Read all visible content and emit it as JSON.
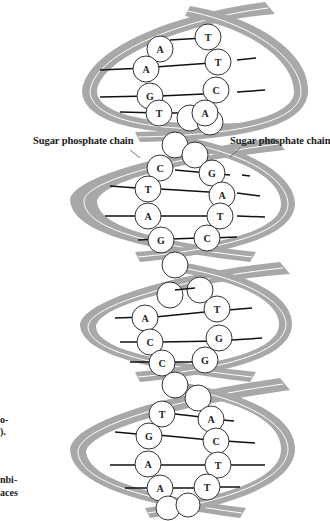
{
  "labels": {
    "left_chain": "Sugar phosphate chain",
    "right_chain": "Sugar phosphate chain"
  },
  "cropped_caption_fragments": [
    "o-",
    ").",
    "nbi-",
    "aces"
  ],
  "colors": {
    "backbone": "#a8a8a8",
    "backbone_highlight": "#ffffff",
    "base_stroke": "#333333",
    "bond": "#111111",
    "background": "#ffffff"
  },
  "turns": [
    {
      "name": "turn-1",
      "pairs": [
        [
          "A",
          "T"
        ],
        [
          "A",
          "T"
        ],
        [
          "G",
          "C"
        ],
        [
          "T",
          "A"
        ]
      ]
    },
    {
      "name": "turn-2",
      "pairs": [
        [
          "C",
          "G"
        ],
        [
          "T",
          "A"
        ],
        [
          "A",
          "T"
        ],
        [
          "G",
          "C"
        ]
      ]
    },
    {
      "name": "turn-3",
      "pairs": [
        [
          "",
          ""
        ],
        [
          "A",
          "T"
        ],
        [
          "C",
          "G"
        ],
        [
          "C",
          "G"
        ]
      ]
    },
    {
      "name": "turn-4",
      "pairs": [
        [
          "T",
          "A"
        ],
        [
          "G",
          "C"
        ],
        [
          "A",
          "T"
        ],
        [
          "A",
          "T"
        ]
      ]
    }
  ]
}
